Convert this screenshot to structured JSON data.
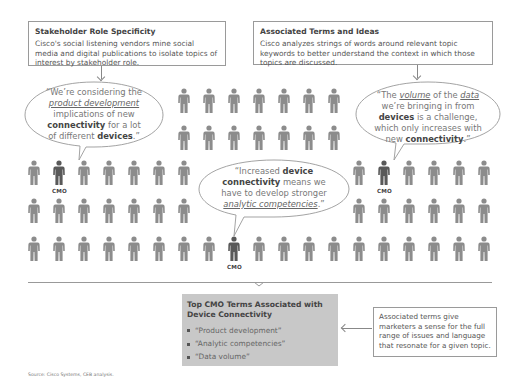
{
  "boxes": {
    "stakeholder": {
      "title": "Stakeholder Role Specificity",
      "text": "Cisco's social listening vendors mine social media and digital publications to isolate topics of interest by stakeholder role."
    },
    "associated": {
      "title": "Associated Terms and Ideas",
      "text": "Cisco analyzes strings of words around relevant topic keywords to better understand the context in which those topics are discussed."
    }
  },
  "quotes": {
    "left": {
      "parts": [
        {
          "t": "“We’re considering the "
        },
        {
          "t": "product development",
          "style": "u"
        },
        {
          "t": " implications of new "
        },
        {
          "t": "connectivity",
          "style": "b"
        },
        {
          "t": " for a lot of different "
        },
        {
          "t": "devices",
          "style": "b"
        },
        {
          "t": ".”"
        }
      ]
    },
    "center": {
      "parts": [
        {
          "t": "“Increased "
        },
        {
          "t": "device connectivity",
          "style": "b"
        },
        {
          "t": " means we have to develop stronger "
        },
        {
          "t": "analytic competencies",
          "style": "u"
        },
        {
          "t": ".”"
        }
      ]
    },
    "right": {
      "parts": [
        {
          "t": "“The "
        },
        {
          "t": "volume",
          "style": "u"
        },
        {
          "t": " of the "
        },
        {
          "t": "data",
          "style": "u"
        },
        {
          "t": " we’re bringing in from "
        },
        {
          "t": "devices",
          "style": "b"
        },
        {
          "t": " is a challenge, which only increases with new "
        },
        {
          "t": "connectivity",
          "style": "b"
        },
        {
          "t": ".”"
        }
      ]
    }
  },
  "cmo_label": "CMO",
  "colors": {
    "figure": "#8c8c8c",
    "figure_cmo": "#595959",
    "summary_bg": "#c8c8c8",
    "border": "#9a9a9a"
  },
  "figures": {
    "rows": [
      {
        "y": 88,
        "cols": [
          184,
          209,
          234,
          259,
          284,
          309,
          334
        ]
      },
      {
        "y": 125,
        "cols": [
          184,
          209,
          234,
          259,
          284,
          309,
          334
        ]
      },
      {
        "y": 160,
        "cols": [
          34,
          59,
          84,
          109,
          134,
          159,
          184,
          359,
          384,
          409,
          434,
          459,
          484
        ]
      },
      {
        "y": 198,
        "cols": [
          34,
          59,
          84,
          109,
          134,
          159,
          184,
          359,
          384,
          409,
          434,
          459,
          484
        ]
      },
      {
        "y": 236,
        "cols": [
          34,
          59,
          84,
          109,
          134,
          159,
          184,
          209,
          234,
          259,
          284,
          309,
          334,
          359,
          384,
          409,
          434,
          459,
          484
        ]
      }
    ],
    "cmo": [
      {
        "row": 2,
        "x": 59
      },
      {
        "row": 2,
        "x": 384
      },
      {
        "row": 4,
        "x": 234
      }
    ]
  },
  "summary": {
    "title": "Top CMO Terms Associated with Device Connectivity",
    "items": [
      "“Product development”",
      "“Analytic competencies”",
      "“Data volume”"
    ]
  },
  "note": {
    "text": "Associated terms give marketers a sense for the full range of issues and language that resonate for a given topic."
  },
  "source": "Source: Cisco Systems, CEB analysis."
}
